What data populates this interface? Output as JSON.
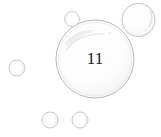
{
  "canvas": {
    "width": 161,
    "height": 137,
    "background_color": "#ffffff"
  },
  "main_bubble": {
    "label": "11",
    "center_x": 95,
    "center_y": 59,
    "radius": 39,
    "stroke_color": "#b9b9b9",
    "stroke_width": 1,
    "fill_color": "#ffffff",
    "label_color": "#1a1a1a",
    "highlight_color": "#e8e8e8"
  },
  "satellite_bubbles": [
    {
      "name": "top-right-bubble",
      "center_x": 138.5,
      "center_y": 20,
      "radius": 16.5,
      "stroke_color": "#c2c2c2",
      "stroke_width": 1
    },
    {
      "name": "top-small-bubble",
      "center_x": 72,
      "center_y": 19,
      "radius": 7.5,
      "stroke_color": "#cdcdcd",
      "stroke_width": 1
    },
    {
      "name": "left-bubble",
      "center_x": 17,
      "center_y": 68,
      "radius": 8,
      "stroke_color": "#c9c9c9",
      "stroke_width": 1
    },
    {
      "name": "bottom-left-bubble",
      "center_x": 50,
      "center_y": 120,
      "radius": 8,
      "stroke_color": "#c9c9c9",
      "stroke_width": 1
    },
    {
      "name": "bottom-right-bubble",
      "center_x": 80,
      "center_y": 120,
      "radius": 8,
      "stroke_color": "#c9c9c9",
      "stroke_width": 1
    }
  ]
}
